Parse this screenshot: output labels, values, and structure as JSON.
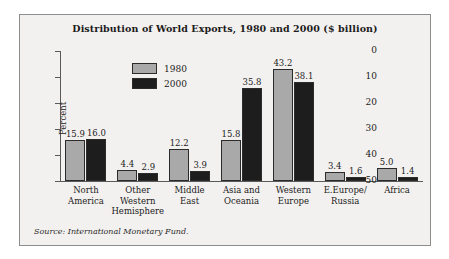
{
  "figure": {
    "title": "Distribution of World Exports, 1980 and 2000 ($ billion)",
    "source_note": "Source: International Monetary Fund."
  },
  "legend": {
    "position": "top-left-inside",
    "entries": [
      {
        "label": "1980",
        "color": "#a9a9a9"
      },
      {
        "label": "2000",
        "color": "#1d1d1d"
      }
    ]
  },
  "axes": {
    "ylabel": "Percent",
    "yticks": [
      "50",
      "40",
      "30",
      "20",
      "10",
      "0"
    ]
  },
  "chart_data": {
    "type": "bar",
    "title": "Distribution of World Exports, 1980 and 2000 ($ billion)",
    "xlabel": "",
    "ylabel": "Percent",
    "ylim": [
      0,
      50
    ],
    "yticks": [
      0,
      10,
      20,
      30,
      40,
      50
    ],
    "grid": false,
    "legend_position": "upper left (inside axes)",
    "annotation": "Source: International Monetary Fund.",
    "categories": [
      "North America",
      "Other Western Hemisphere",
      "Middle East",
      "Asia and Oceania",
      "Western Europe",
      "E.Europe/ Russia",
      "Africa"
    ],
    "category_lines": [
      [
        "North",
        "America"
      ],
      [
        "Other",
        "Western",
        "Hemisphere"
      ],
      [
        "Middle",
        "East"
      ],
      [
        "Asia and",
        "Oceania"
      ],
      [
        "Western",
        "Europe"
      ],
      [
        "E.Europe/",
        "Russia"
      ],
      [
        "Africa"
      ]
    ],
    "series": [
      {
        "name": "1980",
        "color": "#a9a9a9",
        "values": [
          15.9,
          4.4,
          12.2,
          15.8,
          43.2,
          3.4,
          5.0
        ],
        "labels": [
          "15.9",
          "4.4",
          "12.2",
          "15.8",
          "43.2",
          "3.4",
          "5.0"
        ]
      },
      {
        "name": "2000",
        "color": "#1d1d1d",
        "values": [
          16.0,
          2.9,
          3.9,
          35.8,
          38.1,
          1.6,
          1.4
        ],
        "labels": [
          "16.0",
          "2.9",
          "3.9",
          "35.8",
          "38.1",
          "1.6",
          "1.4"
        ]
      }
    ]
  }
}
